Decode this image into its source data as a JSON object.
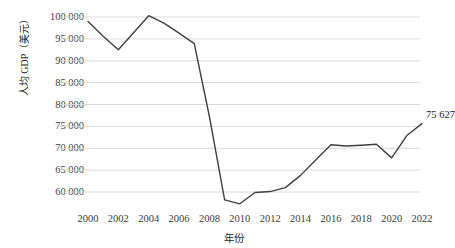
{
  "chart_data": {
    "type": "line",
    "title": "",
    "xlabel": "年份",
    "ylabel": "人均 GDP（美元）",
    "x": [
      2000,
      2001,
      2002,
      2003,
      2004,
      2005,
      2006,
      2007,
      2008,
      2009,
      2010,
      2011,
      2012,
      2013,
      2014,
      2015,
      2016,
      2017,
      2018,
      2019,
      2020,
      2021,
      2022
    ],
    "values": [
      99000,
      95600,
      92500,
      96400,
      100300,
      98600,
      96300,
      93900,
      77200,
      58200,
      57300,
      59900,
      60100,
      61000,
      63800,
      67300,
      70800,
      70500,
      70700,
      70900,
      67800,
      72900,
      75627
    ],
    "categories": [
      "2000",
      "2001",
      "2002",
      "2003",
      "2004",
      "2005",
      "2006",
      "2007",
      "2008",
      "2009",
      "2010",
      "2011",
      "2012",
      "2013",
      "2014",
      "2015",
      "2016",
      "2017",
      "2018",
      "2019",
      "2020",
      "2021",
      "2022"
    ],
    "xtick_labels": [
      "2000",
      "2002",
      "2004",
      "2006",
      "2008",
      "2010",
      "2012",
      "2014",
      "2016",
      "2018",
      "2020",
      "2022"
    ],
    "xtick_values": [
      2000,
      2002,
      2004,
      2006,
      2008,
      2010,
      2012,
      2014,
      2016,
      2018,
      2020,
      2022
    ],
    "ytick_labels": [
      "100 000",
      "95 000",
      "90 000",
      "85 000",
      "80 000",
      "75 000",
      "70 000",
      "65 000",
      "60 000"
    ],
    "ytick_values": [
      100000,
      95000,
      90000,
      85000,
      80000,
      75000,
      70000,
      65000,
      60000
    ],
    "ylim": [
      56000,
      101500
    ],
    "xlim": [
      1999.4,
      2023.2
    ],
    "grid": "horizontal",
    "legend": "none",
    "line_color": "#404040",
    "grid_color": "#d9d9d9",
    "annotations": [
      {
        "label": "75 627",
        "x": 2022,
        "y": 75627
      }
    ]
  },
  "axis": {
    "y_title": "人均 GDP（美元）",
    "x_title": "年份"
  },
  "annotation": {
    "end_value_label": "75 627"
  },
  "colors": {
    "line": "#404040",
    "grid": "#d9d9d9",
    "text": "#333333",
    "background": "#ffffff"
  }
}
